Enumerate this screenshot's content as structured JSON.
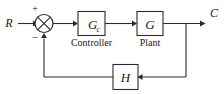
{
  "diagram": {
    "type": "control-system-block-diagram",
    "signals": {
      "input_label": "R",
      "output_label": "C"
    },
    "summing_junction": {
      "name": "summing-junction",
      "plus_sign": "+",
      "minus_sign": "–",
      "shape": "circle-with-cross"
    },
    "blocks": [
      {
        "id": "controller",
        "symbol": "G",
        "subscript": "c",
        "caption": "Controller"
      },
      {
        "id": "plant",
        "symbol": "G",
        "subscript": "",
        "caption": "Plant"
      },
      {
        "id": "feedback",
        "symbol": "H",
        "subscript": "",
        "caption": ""
      }
    ],
    "colors": {
      "line": "#2b2b2b",
      "text": "#1a1a1a",
      "background": "#ffffff"
    }
  }
}
